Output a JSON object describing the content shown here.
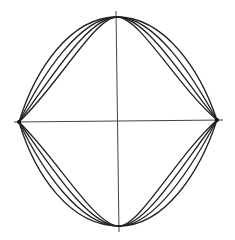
{
  "diagram": {
    "type": "line-drawing",
    "stroke_color": "#222222",
    "axis_color": "#444444",
    "background": "#ffffff",
    "nodes": {
      "left": {
        "x": 19,
        "y": 122
      },
      "right": {
        "x": 217,
        "y": 120
      },
      "top": {
        "x": 117,
        "y": 17
      },
      "bottom": {
        "x": 119,
        "y": 226
      }
    },
    "axes": {
      "vertical": {
        "x1": 116,
        "y1": 11,
        "x2": 119,
        "y2": 232
      },
      "horizontal": {
        "x1": 14,
        "y1": 122,
        "x2": 223,
        "y2": 120
      }
    },
    "curve_count_per_quadrant": 4
  }
}
